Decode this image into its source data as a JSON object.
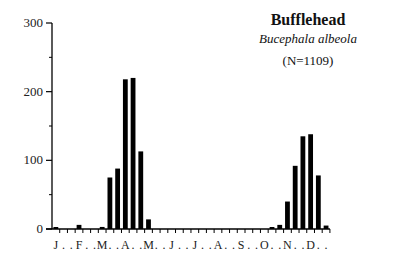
{
  "chart_data": {
    "type": "bar",
    "title": "Bufflehead",
    "subtitle": "Bucephala albeola",
    "annotation": "(N=1109)",
    "xlabel": "",
    "ylabel": "",
    "ylim": [
      0,
      300
    ],
    "yticks": [
      0,
      100,
      200,
      300
    ],
    "y_minor_ticks": [
      50,
      150,
      250
    ],
    "grid": false,
    "legend": null,
    "month_labels": [
      "J",
      "F",
      "M",
      "A",
      "M",
      "J",
      "J",
      "A",
      "S",
      "O",
      "N",
      "D"
    ],
    "x_tick_label_string": "J . . F . . M . . A . . M . . J . . J . . A . . S . . O . . N . . D . .",
    "bins_per_month": 3,
    "categories": [
      "Jan-1",
      "Jan-2",
      "Jan-3",
      "Feb-1",
      "Feb-2",
      "Feb-3",
      "Mar-1",
      "Mar-2",
      "Mar-3",
      "Apr-1",
      "Apr-2",
      "Apr-3",
      "May-1",
      "May-2",
      "May-3",
      "Jun-1",
      "Jun-2",
      "Jun-3",
      "Jul-1",
      "Jul-2",
      "Jul-3",
      "Aug-1",
      "Aug-2",
      "Aug-3",
      "Sep-1",
      "Sep-2",
      "Sep-3",
      "Oct-1",
      "Oct-2",
      "Oct-3",
      "Nov-1",
      "Nov-2",
      "Nov-3",
      "Dec-1",
      "Dec-2",
      "Dec-3"
    ],
    "values": [
      2,
      0,
      0,
      6,
      0,
      0,
      3,
      75,
      88,
      218,
      220,
      113,
      14,
      0,
      0,
      0,
      0,
      0,
      0,
      0,
      0,
      0,
      0,
      0,
      0,
      0,
      0,
      0,
      2,
      6,
      40,
      92,
      135,
      138,
      78,
      5
    ],
    "bar_color": "#000000"
  }
}
